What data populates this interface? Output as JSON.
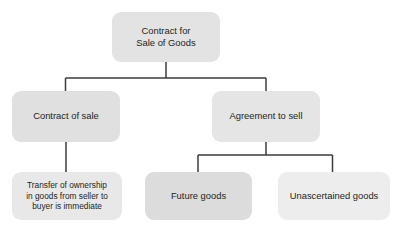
{
  "diagram": {
    "orientation": "top-down-tree",
    "background_color": "#ffffff",
    "connector_color": "#3b3b3b",
    "text_color": "#231f20",
    "nodes": {
      "root": {
        "label": "Contract for\nSale of Goods",
        "fill": "#e3e3e3",
        "level": 0
      },
      "contract_of_sale": {
        "label": "Contract of sale",
        "fill": "#e0e0e0",
        "level": 1
      },
      "agreement_to_sell": {
        "label": "Agreement to sell",
        "fill": "#e5e5e5",
        "level": 1
      },
      "transfer_ownership": {
        "label": "Transfer of ownership\nin goods from seller to\nbuyer is immediate",
        "fill": "#e8e8e8",
        "level": 2
      },
      "future_goods": {
        "label": "Future goods",
        "fill": "#dcdcdc",
        "level": 2
      },
      "unascertained_goods": {
        "label": "Unascertained goods",
        "fill": "#ededed",
        "level": 2
      }
    },
    "edges": [
      {
        "from": "root",
        "to": "contract_of_sale"
      },
      {
        "from": "root",
        "to": "agreement_to_sell"
      },
      {
        "from": "contract_of_sale",
        "to": "transfer_ownership"
      },
      {
        "from": "agreement_to_sell",
        "to": "future_goods"
      },
      {
        "from": "agreement_to_sell",
        "to": "unascertained_goods"
      }
    ]
  }
}
